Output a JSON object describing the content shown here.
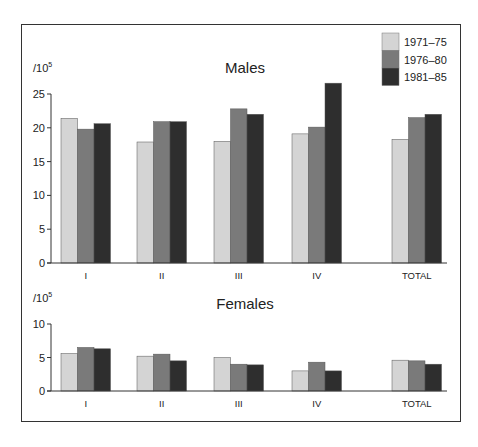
{
  "chart_data": [
    {
      "type": "bar",
      "title": "Males",
      "unit_label": "/10",
      "unit_exponent": "5",
      "categories": [
        "I",
        "II",
        "III",
        "IV",
        "TOTAL"
      ],
      "series": [
        {
          "name": "1971–75",
          "values": [
            21.4,
            17.9,
            18.0,
            19.1,
            18.3
          ]
        },
        {
          "name": "1976–80",
          "values": [
            19.8,
            20.9,
            22.8,
            20.1,
            21.5
          ]
        },
        {
          "name": "1981–85",
          "values": [
            20.6,
            20.9,
            22.0,
            26.6,
            22.0
          ]
        }
      ],
      "ylim": [
        0,
        25
      ],
      "yticks": [
        0,
        5,
        10,
        15,
        20,
        25
      ],
      "xlabel": "",
      "ylabel": "/10^5",
      "grid": false,
      "legend_position": "top-right"
    },
    {
      "type": "bar",
      "title": "Females",
      "unit_label": "/10",
      "unit_exponent": "5",
      "categories": [
        "I",
        "II",
        "III",
        "IV",
        "TOTAL"
      ],
      "series": [
        {
          "name": "1971–75",
          "values": [
            5.6,
            5.2,
            5.0,
            3.0,
            4.6
          ]
        },
        {
          "name": "1976–80",
          "values": [
            6.5,
            5.5,
            4.0,
            4.3,
            4.5
          ]
        },
        {
          "name": "1981–85",
          "values": [
            6.3,
            4.5,
            3.9,
            3.0,
            4.0
          ]
        }
      ],
      "ylim": [
        0,
        10
      ],
      "yticks": [
        0,
        5,
        10
      ],
      "xlabel": "",
      "ylabel": "/10^5",
      "grid": false
    }
  ],
  "legend": {
    "items": [
      {
        "label": "1971–75",
        "color": "#d4d4d4"
      },
      {
        "label": "1976–80",
        "color": "#7a7a7a"
      },
      {
        "label": "1981–85",
        "color": "#2e2e2e"
      }
    ]
  }
}
